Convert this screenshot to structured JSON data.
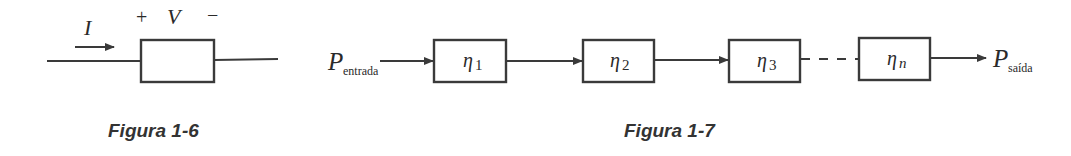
{
  "figures": {
    "fig6": {
      "caption": "Figura 1-6",
      "current_label": "I",
      "voltage_label": "V",
      "plus_sign": "+",
      "minus_sign": "−"
    },
    "fig7": {
      "caption": "Figura 1-7",
      "input": {
        "symbol": "P",
        "subscript": "entrada"
      },
      "output": {
        "symbol": "P",
        "subscript": "saída"
      },
      "stages": [
        {
          "symbol": "η",
          "index": "1"
        },
        {
          "symbol": "η",
          "index": "2"
        },
        {
          "symbol": "η",
          "index": "3"
        },
        {
          "symbol": "η",
          "index": "n"
        }
      ]
    }
  },
  "colors": {
    "ink": "#3a3a3a",
    "background": "#ffffff"
  }
}
